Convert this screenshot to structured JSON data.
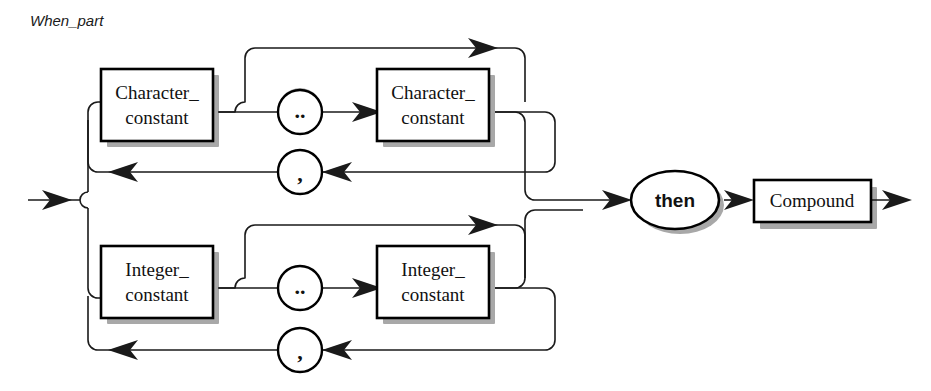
{
  "diagram": {
    "kind": "railroad-syntax-diagram",
    "title": "When_part",
    "canvas": {
      "width": 931,
      "height": 391
    },
    "colors": {
      "background": "#ffffff",
      "line": "#1a1a1a",
      "box_stroke": "#000000",
      "box_fill": "#ffffff",
      "shadow": "#a8a8a8",
      "text": "#111111"
    },
    "alternatives": [
      {
        "id": "character-branch",
        "first_item_line_1": "Character_",
        "first_item_line_2": "constant",
        "range_operator": "..",
        "second_item_line_1": "Character_",
        "second_item_line_2": "constant",
        "repeat_separator": ","
      },
      {
        "id": "integer-branch",
        "first_item_line_1": "Integer_",
        "first_item_line_2": "constant",
        "range_operator": "..",
        "second_item_line_1": "Integer_",
        "second_item_line_2": "constant",
        "repeat_separator": ","
      }
    ],
    "tail": {
      "keyword": "then",
      "nonterminal": "Compound"
    },
    "node_labels": {
      "char_const_1": "Character_ constant",
      "char_const_2": "Character_ constant",
      "int_const_1": "Integer_ constant",
      "int_const_2": "Integer_ constant",
      "range_top": "..",
      "range_bottom": "..",
      "comma_top": ",",
      "comma_bottom": ",",
      "then": "then",
      "compound": "Compound"
    }
  }
}
